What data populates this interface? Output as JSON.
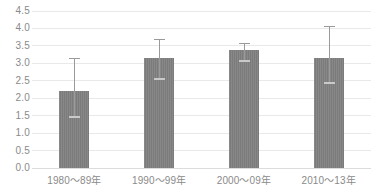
{
  "chart_data": {
    "type": "bar",
    "title": "",
    "subtitle": "",
    "xlabel": "",
    "ylabel": "",
    "categories": [
      "1980〜89年",
      "1990〜99年",
      "2000〜09年",
      "2010〜13年"
    ],
    "values": [
      2.21,
      3.14,
      3.37,
      3.16
    ],
    "error_low": [
      1.46,
      2.54,
      3.08,
      2.43
    ],
    "error_high": [
      3.15,
      3.7,
      3.59,
      4.07
    ],
    "ylim": [
      0.0,
      4.5
    ],
    "ytick_values": [
      0.0,
      0.5,
      1.0,
      1.5,
      2.0,
      2.5,
      3.0,
      3.5,
      4.0,
      4.5
    ],
    "ytick_labels": [
      "0.0",
      "0.5",
      "1.0",
      "1.5",
      "2.0",
      "2.5",
      "3.0",
      "3.5",
      "4.0",
      "4.5"
    ],
    "grid": true,
    "legend": "none",
    "series": [
      {
        "name": "value",
        "values": [
          2.21,
          3.14,
          3.37,
          3.16
        ]
      }
    ],
    "bar_color": "#7b7b7b",
    "gridline_color": "#e9e9e9",
    "tick_label_color": "#8a8a8a",
    "errorbar_color": "#9a9a9a"
  },
  "axis": {
    "y": {
      "ticks": [
        {
          "label": "4.5",
          "value": 4.5
        },
        {
          "label": "4.0",
          "value": 4.0
        },
        {
          "label": "3.5",
          "value": 3.5
        },
        {
          "label": "3.0",
          "value": 3.0
        },
        {
          "label": "2.5",
          "value": 2.5
        },
        {
          "label": "2.0",
          "value": 2.0
        },
        {
          "label": "1.5",
          "value": 1.5
        },
        {
          "label": "1.0",
          "value": 1.0
        },
        {
          "label": "0.5",
          "value": 0.5
        },
        {
          "label": "0.0",
          "value": 0.0
        }
      ]
    },
    "x": {
      "ticks": [
        {
          "label": "1980〜89年"
        },
        {
          "label": "1990〜99年"
        },
        {
          "label": "2000〜09年"
        },
        {
          "label": "2010〜13年"
        }
      ]
    }
  }
}
